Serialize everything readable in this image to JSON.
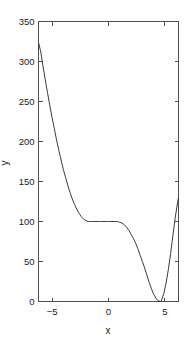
{
  "chart_data": {
    "type": "line",
    "title": "",
    "xlabel": "x",
    "ylabel": "y",
    "xlim": [
      -6.2,
      6.2
    ],
    "ylim": [
      0,
      350
    ],
    "grid": false,
    "legend": null,
    "xticks": [
      -5,
      0,
      5
    ],
    "xticklabels": [
      "−5",
      "0",
      "5"
    ],
    "yticks": [
      0,
      50,
      100,
      150,
      200,
      250,
      300,
      350
    ],
    "yticklabels": [
      "0",
      "50",
      "100",
      "150",
      "200",
      "250",
      "300",
      "350"
    ],
    "line_color": "#3a3a3a",
    "axis_color": "#4d4d4d",
    "background_color": "#ffffff",
    "series": [
      {
        "name": "curve",
        "x": [
          -6.2,
          -6.0,
          -5.8,
          -5.6,
          -5.4,
          -5.2,
          -5.0,
          -4.8,
          -4.6,
          -4.4,
          -4.2,
          -4.0,
          -3.8,
          -3.6,
          -3.4,
          -3.2,
          -3.0,
          -2.8,
          -2.6,
          -2.4,
          -2.2,
          -2.0,
          -1.8,
          -1.6,
          -1.4,
          -1.2,
          -1.0,
          -0.8,
          -0.6,
          -0.4,
          -0.2,
          0.0,
          0.2,
          0.4,
          0.6,
          0.8,
          1.0,
          1.2,
          1.4,
          1.6,
          1.8,
          2.0,
          2.2,
          2.4,
          2.6,
          2.8,
          3.0,
          3.2,
          3.4,
          3.6,
          3.8,
          4.0,
          4.2,
          4.4,
          4.6,
          4.65,
          4.7,
          4.9,
          5.1,
          5.3,
          5.5,
          5.7,
          5.9,
          6.1,
          6.2
        ],
        "y": [
          324,
          312,
          294,
          277,
          261,
          245,
          230,
          216,
          202,
          189,
          177,
          165,
          155,
          145,
          136,
          128,
          121,
          115,
          110,
          106,
          103,
          101,
          100,
          100,
          100,
          100,
          100,
          100,
          100,
          100,
          100,
          100,
          100,
          100,
          100,
          100,
          99,
          98,
          96,
          93,
          89,
          84,
          79,
          73,
          66,
          58,
          50,
          42,
          33,
          24,
          16,
          9,
          4,
          1,
          0,
          0,
          2,
          10,
          23,
          40,
          60,
          82,
          104,
          122,
          130
        ]
      }
    ]
  },
  "axes": {
    "xlabel": "x",
    "ylabel": "y"
  }
}
